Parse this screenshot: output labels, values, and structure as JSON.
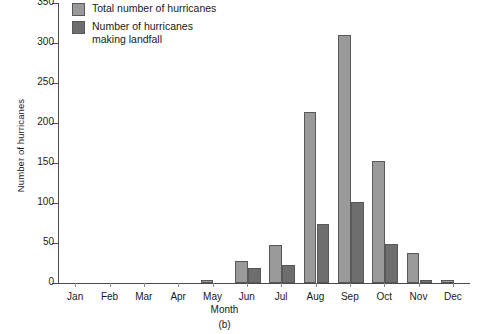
{
  "figure": {
    "caption": "(b)",
    "ylabel": "Number of hurricanes",
    "xlabel": "Month"
  },
  "legend": {
    "items": [
      {
        "label": "Total number of hurricanes",
        "color": "#9a9a9a",
        "name": "total"
      },
      {
        "label": "Number of hurricanes\nmaking landfall",
        "color": "#6e6e6e",
        "name": "landfall"
      }
    ]
  },
  "chart_data": {
    "type": "bar",
    "title": "",
    "xlabel": "Month",
    "ylabel": "Number of hurricanes",
    "categories": [
      "Jan",
      "Feb",
      "Mar",
      "Apr",
      "May",
      "Jun",
      "Jul",
      "Aug",
      "Sep",
      "Oct",
      "Nov",
      "Dec"
    ],
    "series": [
      {
        "name": "Total number of hurricanes",
        "color": "#9a9a9a",
        "values": [
          0,
          0,
          0,
          0,
          4,
          28,
          47,
          214,
          310,
          153,
          37,
          4
        ]
      },
      {
        "name": "Number of hurricanes making landfall",
        "color": "#6e6e6e",
        "values": [
          0,
          0,
          0,
          0,
          0,
          19,
          23,
          74,
          101,
          49,
          4,
          0
        ]
      }
    ],
    "ylim": [
      0,
      350
    ],
    "yticks": [
      0,
      50,
      100,
      150,
      200,
      250,
      300,
      350
    ],
    "grid": false,
    "legend_position": "top-left"
  }
}
